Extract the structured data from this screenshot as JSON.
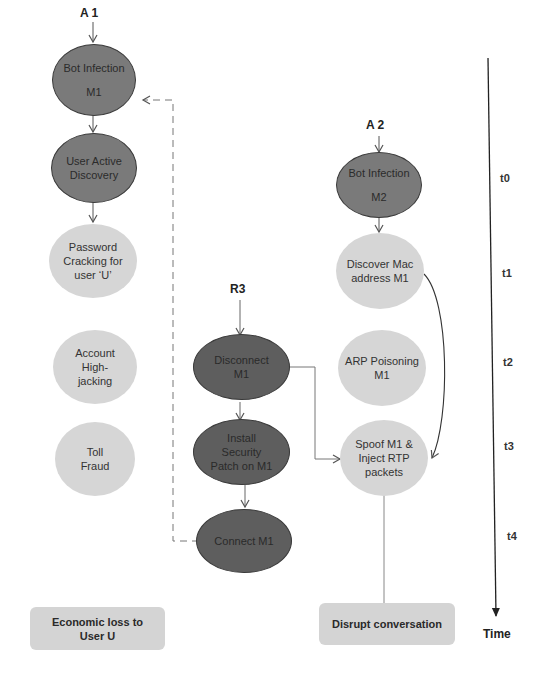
{
  "actors": {
    "a1": "A 1",
    "a2": "A 2",
    "r3": "R3"
  },
  "chain_a1": [
    {
      "id": "bot-infection-m1",
      "lines": [
        "Bot Infection",
        "M1"
      ],
      "shade": "dark"
    },
    {
      "id": "user-active-discovery",
      "lines": [
        "User Active",
        "Discovery"
      ],
      "shade": "dark"
    },
    {
      "id": "password-cracking",
      "lines": [
        "Password",
        "Cracking for",
        "user ‘U’"
      ],
      "shade": "light"
    },
    {
      "id": "account-highjacking",
      "lines": [
        "Account",
        "High-",
        "jacking"
      ],
      "shade": "light"
    },
    {
      "id": "toll-fraud",
      "lines": [
        "Toll",
        "Fraud"
      ],
      "shade": "light"
    }
  ],
  "chain_r3": [
    {
      "id": "disconnect-m1",
      "lines": [
        "Disconnect",
        "M1"
      ],
      "shade": "darker"
    },
    {
      "id": "install-security-patch",
      "lines": [
        "Install",
        "Security",
        "Patch on M1"
      ],
      "shade": "darker"
    },
    {
      "id": "connect-m1",
      "lines": [
        "Connect M1"
      ],
      "shade": "darker"
    }
  ],
  "chain_a2": [
    {
      "id": "bot-infection-m2",
      "lines": [
        "Bot Infection",
        "M2"
      ],
      "shade": "dark"
    },
    {
      "id": "discover-mac",
      "lines": [
        "Discover Mac",
        "address M1"
      ],
      "shade": "light"
    },
    {
      "id": "arp-poisoning",
      "lines": [
        "ARP Poisoning",
        "M1"
      ],
      "shade": "light"
    },
    {
      "id": "spoof-inject",
      "lines": [
        "Spoof M1 &",
        "Inject RTP",
        "packets"
      ],
      "shade": "light"
    }
  ],
  "outcomes": {
    "economic_loss": [
      "Economic loss to",
      "User U"
    ],
    "disrupt": "Disrupt conversation"
  },
  "timeline": {
    "ticks": [
      "t0",
      "t1",
      "t2",
      "t3",
      "t4"
    ],
    "axis_label": "Time"
  },
  "colors": {
    "dark_node": "#7a7a7a",
    "darker_node": "#5e5e5e",
    "light_node": "#d6d6d6",
    "line": "#555555"
  }
}
